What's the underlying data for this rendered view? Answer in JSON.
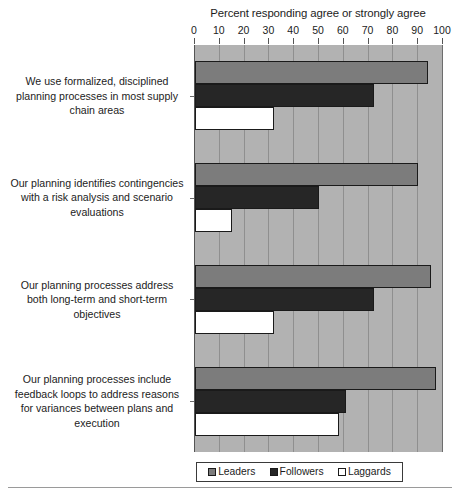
{
  "chart_data": {
    "type": "bar",
    "orientation": "horizontal",
    "title": "Percent responding agree or strongly agree",
    "xlabel": "",
    "ylabel": "",
    "xlim": [
      0,
      100
    ],
    "xticks": [
      0,
      10,
      20,
      30,
      40,
      50,
      60,
      70,
      80,
      90,
      100
    ],
    "grid": true,
    "legend_position": "bottom",
    "categories": [
      "We use formalized, disciplined planning processes in most supply chain areas",
      "Our planning identifies contingencies with a risk analysis and scenario evaluations",
      "Our planning processes address both long-term and short-term objectives",
      "Our planning processes include feedback loops to address reasons for variances between plans and execution"
    ],
    "category_lines": [
      [
        "We use formalized, disciplined",
        "planning processes in most supply",
        "chain areas"
      ],
      [
        "Our planning identifies contingencies",
        "with a risk analysis and scenario",
        "evaluations"
      ],
      [
        "Our planning processes address",
        "both long-term and short-term",
        "objectives"
      ],
      [
        "Our planning processes include",
        "feedback loops to address reasons",
        "for variances between plans and",
        "execution"
      ]
    ],
    "series": [
      {
        "name": "Leaders",
        "color": "#7c7c7c",
        "values": [
          94,
          90,
          95,
          97
        ]
      },
      {
        "name": "Followers",
        "color": "#262626",
        "values": [
          72,
          50,
          72,
          61
        ]
      },
      {
        "name": "Laggards",
        "color": "#ffffff",
        "values": [
          32,
          15,
          32,
          58
        ]
      }
    ]
  },
  "colors": {
    "leaders": "#7c7c7c",
    "followers": "#262626",
    "laggards": "#ffffff",
    "plot_background": "#b2b2b2",
    "gridline": "#8f8f8f",
    "axis": "#555555",
    "text": "#1c1c1c"
  },
  "legend": {
    "items": [
      {
        "label": "Leaders"
      },
      {
        "label": "Followers"
      },
      {
        "label": "Laggards"
      }
    ]
  }
}
